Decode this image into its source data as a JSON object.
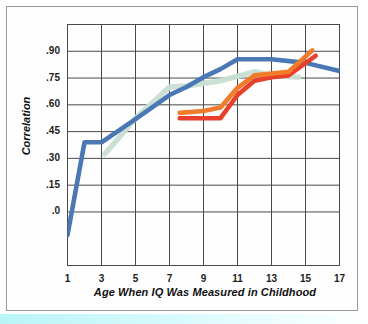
{
  "chart_data": {
    "type": "line",
    "title": "",
    "xlabel": "Age When IQ Was Measured in Childhood",
    "ylabel": "Correlation",
    "xlim": [
      1,
      17
    ],
    "ylim": [
      -0.15,
      0.975
    ],
    "grid": true,
    "legend_position": "none",
    "x_tick_labels": [
      "1",
      "3",
      "5",
      "7",
      "9",
      "11",
      "13",
      "15",
      "17"
    ],
    "x_tick_values": [
      1,
      3,
      5,
      7,
      9,
      11,
      13,
      15,
      17
    ],
    "y_tick_labels": [
      ".90",
      ".75",
      ".60",
      ".45",
      ".30",
      ".15",
      ".0"
    ],
    "y_tick_values": [
      0.9,
      0.75,
      0.6,
      0.45,
      0.3,
      0.15,
      0.0
    ],
    "series": [
      {
        "name": "blue-series",
        "color": "#4A78B5",
        "points": [
          [
            1.0,
            -0.13
          ],
          [
            2.0,
            0.39
          ],
          [
            3.0,
            0.39
          ],
          [
            5.0,
            0.52
          ],
          [
            7.0,
            0.655
          ],
          [
            8.0,
            0.7
          ],
          [
            9.0,
            0.755
          ],
          [
            10.0,
            0.8
          ],
          [
            11.0,
            0.855
          ],
          [
            13.0,
            0.855
          ],
          [
            15.0,
            0.835
          ],
          [
            17.0,
            0.79
          ]
        ]
      },
      {
        "name": "mint-series",
        "color": "#C9DFD4",
        "points": [
          [
            3.2,
            0.325
          ],
          [
            5.0,
            0.525
          ],
          [
            7.0,
            0.7
          ],
          [
            8.0,
            0.705
          ],
          [
            10.0,
            0.735
          ],
          [
            12.0,
            0.785
          ],
          [
            13.0,
            0.765
          ],
          [
            14.6,
            0.755
          ]
        ]
      },
      {
        "name": "orange-series",
        "color": "#F07B2A",
        "points": [
          [
            7.6,
            0.555
          ],
          [
            9.0,
            0.565
          ],
          [
            10.0,
            0.585
          ],
          [
            11.0,
            0.695
          ],
          [
            12.0,
            0.765
          ],
          [
            13.0,
            0.775
          ],
          [
            14.0,
            0.785
          ],
          [
            15.4,
            0.905
          ]
        ]
      },
      {
        "name": "red-series",
        "color": "#E8402A",
        "points": [
          [
            7.6,
            0.525
          ],
          [
            9.0,
            0.525
          ],
          [
            10.0,
            0.525
          ],
          [
            11.0,
            0.655
          ],
          [
            12.0,
            0.735
          ],
          [
            13.0,
            0.755
          ],
          [
            14.0,
            0.765
          ],
          [
            15.6,
            0.875
          ]
        ]
      }
    ]
  },
  "colors": {
    "blue": "#4A78B5",
    "mint": "#C9DFD4",
    "orange": "#F07B2A",
    "red": "#E8402A",
    "grid": "#4a4a4a",
    "frame": "#9a9a9a",
    "bottom_strip": "#b8f4f7"
  }
}
